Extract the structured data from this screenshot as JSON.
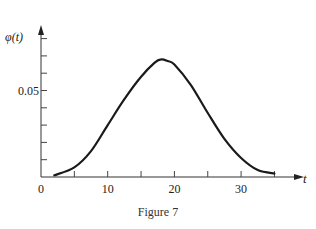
{
  "chart_data": {
    "type": "line",
    "title": "",
    "caption": "Figure 7",
    "xlabel": "t",
    "ylabel": "φ(t)",
    "xlim": [
      0,
      38
    ],
    "ylim": [
      0,
      0.08
    ],
    "x_ticks": [
      0,
      5,
      10,
      15,
      20,
      25,
      30,
      35
    ],
    "x_tick_labels": [
      "0",
      "",
      "10",
      "",
      "20",
      "",
      "30",
      ""
    ],
    "y_ticks": [
      0.01,
      0.02,
      0.03,
      0.04,
      0.05,
      0.06,
      0.07,
      0.08
    ],
    "y_tick_labels": [
      "",
      "",
      "",
      "",
      "0.05",
      "",
      "",
      ""
    ],
    "grid": false,
    "legend": null,
    "series": [
      {
        "name": "φ(t)",
        "x": [
          2,
          5,
          7.5,
          10,
          12.5,
          15,
          17,
          18,
          19,
          20,
          22.5,
          25,
          27.5,
          30,
          32.5,
          35
        ],
        "y": [
          0.001,
          0.0056,
          0.015,
          0.03,
          0.045,
          0.058,
          0.066,
          0.068,
          0.067,
          0.065,
          0.053,
          0.037,
          0.022,
          0.011,
          0.004,
          0.002
        ]
      }
    ]
  },
  "figure": {
    "caption": "Figure 7"
  }
}
